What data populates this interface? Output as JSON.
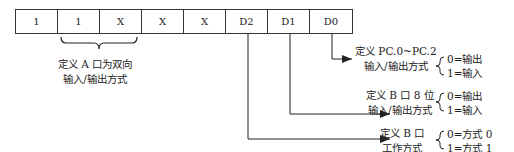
{
  "register": {
    "bits": [
      "1",
      "1",
      "X",
      "X",
      "X",
      "D2",
      "D1",
      "D0"
    ]
  },
  "group_a": {
    "line1": "定义 A 口为双向",
    "line2": "输入/输出方式"
  },
  "d0": {
    "line1": "定义 PC.0~PC.2",
    "line2": "输入/输出方式",
    "opt0": "0=输出",
    "opt1": "1=输入"
  },
  "d1": {
    "line1": "定义 B 口 8 位",
    "line2": "输入/输出方式",
    "opt0": "0=输出",
    "opt1": "1=输入"
  },
  "d2": {
    "line1": "定义 B 口",
    "line2": "工作方式",
    "opt0": "0=方式 0",
    "opt1": "1=方式 1"
  }
}
